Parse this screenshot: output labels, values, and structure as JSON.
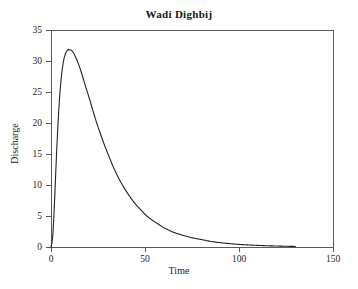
{
  "chart_data": {
    "type": "line",
    "title": "Wadi Dighbij",
    "xlabel": "Time",
    "ylabel": "Discharge",
    "xlim": [
      0,
      150
    ],
    "ylim": [
      0,
      35
    ],
    "grid": false,
    "legend": null,
    "xticks": [
      0,
      50,
      100,
      150
    ],
    "xtick_labels": [
      "0",
      "50",
      "100",
      "150"
    ],
    "yticks": [
      0,
      5,
      10,
      15,
      20,
      25,
      30,
      35
    ],
    "ytick_labels": [
      "0",
      "5",
      "10",
      "15",
      "20",
      "25",
      "30",
      "35"
    ],
    "series": [
      {
        "name": "Discharge hydrograph",
        "color": "#222222",
        "line_width": 1,
        "x": [
          0,
          1,
          2,
          3,
          4,
          5,
          6,
          7,
          8,
          9,
          10,
          11,
          12,
          13,
          14,
          15,
          16,
          17,
          18,
          19,
          20,
          22,
          24,
          26,
          28,
          30,
          33,
          36,
          39,
          42,
          45,
          48,
          51,
          54,
          57,
          60,
          65,
          70,
          75,
          80,
          85,
          90,
          95,
          100,
          105,
          110,
          115,
          120,
          125,
          130
        ],
        "y": [
          0,
          2.0,
          8.2,
          15.4,
          21.4,
          25.8,
          28.7,
          30.5,
          31.4,
          31.8,
          31.8,
          31.7,
          31.3,
          30.7,
          30.0,
          29.2,
          28.3,
          27.3,
          26.3,
          25.3,
          24.3,
          22.3,
          20.3,
          18.5,
          16.8,
          15.2,
          13.0,
          11.1,
          9.5,
          8.1,
          6.9,
          5.9,
          5.0,
          4.3,
          3.7,
          3.1,
          2.4,
          1.9,
          1.5,
          1.2,
          0.9,
          0.7,
          0.55,
          0.42,
          0.33,
          0.26,
          0.2,
          0.16,
          0.12,
          0.09
        ]
      }
    ],
    "peak": {
      "time": 10,
      "discharge": 31.8
    },
    "axis_color": "#4a4a4a",
    "background_color": "#ffffff"
  },
  "figure": {
    "title": "Wadi Dighbij",
    "xlabel": "Time",
    "ylabel": "Discharge"
  }
}
